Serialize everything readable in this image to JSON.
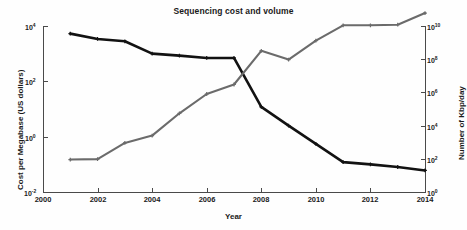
{
  "chart_data": {
    "type": "line",
    "title": "Sequencing cost and volume",
    "xlabel": "Year",
    "ylabel": "Cost per Megabase (US dollars)",
    "y2label": "Number of Kbp/day",
    "grid": false,
    "legend": "none",
    "xlim": [
      2000,
      2014
    ],
    "xticks": [
      2000,
      2002,
      2004,
      2006,
      2008,
      2010,
      2012,
      2014
    ],
    "xticklabels": [
      "2000",
      "2002",
      "2004",
      "2006",
      "2008",
      "2010",
      "2012",
      "2014"
    ],
    "yscale": "log",
    "ylim": [
      0.01,
      10000
    ],
    "yticks": [
      0.01,
      1,
      100,
      10000
    ],
    "yticklabels": [
      "10-2",
      "100",
      "102",
      "104"
    ],
    "ytick_base": "10",
    "ytick_exponents": [
      "-2",
      "0",
      "2",
      "4"
    ],
    "y2scale": "log",
    "y2lim": [
      1,
      10000000000
    ],
    "y2ticks": [
      1,
      100,
      10000,
      1000000,
      100000000,
      10000000000
    ],
    "y2tick_exponents": [
      "0",
      "2",
      "4",
      "6",
      "8",
      "10"
    ],
    "x": [
      2001,
      2002,
      2003,
      2004,
      2005,
      2006,
      2007,
      2008,
      2009,
      2010,
      2011,
      2012,
      2013,
      2014
    ],
    "series": [
      {
        "name": "Cost per Megabase (US dollars)",
        "axis": "left",
        "color": "#121212",
        "values": [
          5290,
          3400,
          2800,
          1000,
          850,
          700,
          700,
          12,
          2.5,
          0.55,
          0.12,
          0.1,
          0.08,
          0.06
        ]
      },
      {
        "name": "Number of Kbp/day",
        "axis": "right",
        "color": "#6b6b6b",
        "values": [
          90,
          95,
          900,
          2500,
          55000,
          800000,
          3000000,
          320000000,
          95000000,
          1300000000,
          11000000000,
          11000000000,
          12000000000,
          60000000000
        ]
      }
    ]
  },
  "axis_titles": {
    "left": "Cost per Megabase (US dollars)",
    "right": "Number of Kbp/day",
    "bottom": "Year"
  },
  "title": "Sequencing cost and volume"
}
